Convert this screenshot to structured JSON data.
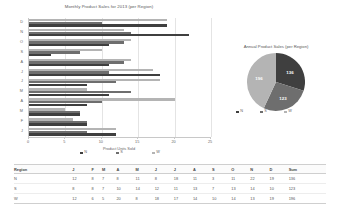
{
  "bar_chart": {
    "title": "Monthly Product Sales for 2013 (per Region)",
    "xlabel": "Product Units Sold",
    "xticks": [
      "0",
      "5",
      "10",
      "15",
      "20",
      "25"
    ],
    "ylabels": [
      "D",
      "N",
      "O",
      "S",
      "A",
      "J",
      "J",
      "M",
      "A",
      "M",
      "F",
      "J"
    ],
    "legend": [
      "N",
      "S",
      "W"
    ]
  },
  "pie_chart": {
    "title": "Annual Product Sales (per Region)",
    "legend": [
      "N",
      "S",
      "W"
    ],
    "labels": [
      "136",
      "123",
      "196"
    ]
  },
  "table": {
    "headers": [
      "Region",
      "J",
      "F",
      "M",
      "A",
      "M",
      "J",
      "J",
      "A",
      "S",
      "O",
      "N",
      "D",
      "Sum"
    ],
    "rows": [
      [
        "N",
        "12",
        "8",
        "7",
        "8",
        "11",
        "8",
        "18",
        "11",
        "3",
        "11",
        "22",
        "19",
        "136"
      ],
      [
        "S",
        "8",
        "8",
        "7",
        "10",
        "14",
        "12",
        "11",
        "13",
        "7",
        "13",
        "14",
        "10",
        "123"
      ],
      [
        "W",
        "12",
        "6",
        "5",
        "20",
        "8",
        "18",
        "17",
        "14",
        "10",
        "14",
        "13",
        "19",
        "196"
      ]
    ]
  },
  "chart_data": [
    {
      "type": "bar",
      "orientation": "horizontal",
      "title": "Monthly Product Sales for 2013 (per Region)",
      "xlabel": "Product Units Sold",
      "ylabel": "",
      "xlim": [
        0,
        25
      ],
      "grid": true,
      "legend_position": "bottom",
      "categories": [
        "J",
        "F",
        "M",
        "A",
        "M",
        "J",
        "J",
        "A",
        "S",
        "O",
        "N",
        "D"
      ],
      "category_order_displayed": [
        "D",
        "N",
        "O",
        "S",
        "A",
        "J",
        "J",
        "M",
        "A",
        "M",
        "F",
        "J"
      ],
      "series": [
        {
          "name": "N",
          "color": "#3f3f3f",
          "values": [
            12,
            8,
            7,
            8,
            11,
            8,
            18,
            11,
            3,
            11,
            22,
            19
          ]
        },
        {
          "name": "S",
          "color": "#6e6e6e",
          "values": [
            8,
            8,
            7,
            10,
            14,
            12,
            11,
            13,
            7,
            13,
            14,
            10
          ]
        },
        {
          "name": "W",
          "color": "#b4b4b4",
          "values": [
            12,
            6,
            5,
            20,
            8,
            18,
            17,
            14,
            10,
            14,
            13,
            19
          ]
        }
      ]
    },
    {
      "type": "pie",
      "title": "Annual Product Sales (per Region)",
      "legend_position": "bottom",
      "labels": [
        "N",
        "S",
        "W"
      ],
      "values": [
        136,
        123,
        196
      ],
      "data_labels": [
        "136",
        "123",
        "196"
      ],
      "colors": [
        "#3f3f3f",
        "#6e6e6e",
        "#b4b4b4"
      ]
    },
    {
      "type": "table",
      "columns": [
        "Region",
        "J",
        "F",
        "M",
        "A",
        "M",
        "J",
        "J",
        "A",
        "S",
        "O",
        "N",
        "D",
        "Sum"
      ],
      "rows": [
        [
          "N",
          12,
          8,
          7,
          8,
          11,
          8,
          18,
          11,
          3,
          11,
          22,
          19,
          136
        ],
        [
          "S",
          8,
          8,
          7,
          10,
          14,
          12,
          11,
          13,
          7,
          13,
          14,
          10,
          123
        ],
        [
          "W",
          12,
          6,
          5,
          20,
          8,
          18,
          17,
          14,
          10,
          14,
          13,
          19,
          196
        ]
      ]
    }
  ]
}
